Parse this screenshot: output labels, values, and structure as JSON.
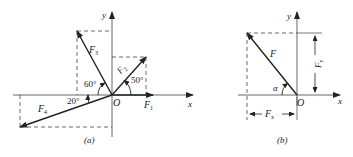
{
  "figures": [
    {
      "id": "a",
      "caption": "(a)",
      "axes": {
        "x_label": "x",
        "y_label": "y",
        "origin_label": "O"
      },
      "forces": [
        {
          "name": "F1",
          "label": "F",
          "sub": "1",
          "angle_deg": 0
        },
        {
          "name": "F2",
          "label": "F",
          "sub": "2",
          "angle_deg": 50,
          "angle_label": "50°"
        },
        {
          "name": "F3",
          "label": "F",
          "sub": "3",
          "angle_deg": 120,
          "angle_label": "60°"
        },
        {
          "name": "F4",
          "label": "F",
          "sub": "4",
          "angle_deg": 200,
          "angle_label": "20°"
        }
      ]
    },
    {
      "id": "b",
      "caption": "(b)",
      "axes": {
        "x_label": "x",
        "y_label": "y",
        "origin_label": "O"
      },
      "force": {
        "label": "F",
        "angle_label": "α"
      },
      "components": {
        "fx_label": "F",
        "fx_sub": "x",
        "fy_label": "F",
        "fy_sub": "y"
      }
    }
  ],
  "colors": {
    "line": "#222222",
    "dashed": "#444444"
  }
}
